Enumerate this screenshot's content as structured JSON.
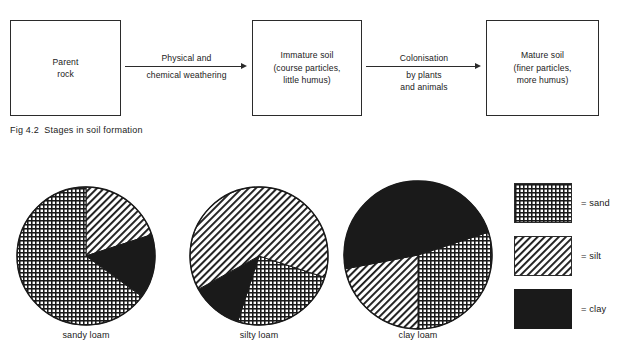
{
  "figure": {
    "caption": "Fig 4.2  Stages in soil formation"
  },
  "flow": {
    "boxes": [
      {
        "id": "parent-rock",
        "text": "Parent\nrock"
      },
      {
        "id": "immature-soil",
        "text": "Immature soil\n(course particles,\nlittle humus)"
      },
      {
        "id": "mature-soil",
        "text": "Mature soil\n(finer particles,\nmore humus)"
      }
    ],
    "arrows": [
      {
        "id": "weathering",
        "label_top": "Physical and",
        "label_bottom": "chemical weathering"
      },
      {
        "id": "colonisation",
        "label_top": "Colonisation",
        "label_bottom": "by plants\nand animals"
      }
    ]
  },
  "legend": {
    "items": [
      {
        "key": "sand",
        "pattern": "crosshatch",
        "text": "= sand"
      },
      {
        "key": "silt",
        "pattern": "diagonal",
        "text": "= silt"
      },
      {
        "key": "clay",
        "pattern": "solid",
        "text": "= clay"
      }
    ]
  },
  "colors": {
    "ink": "#2b2b2b",
    "paper": "#ffffff",
    "clay_fill": "#1a1a1a"
  },
  "chart_data": {
    "type": "pie",
    "categories": [
      "sand",
      "silt",
      "clay"
    ],
    "legend_position": "right",
    "start_angle_deg": 0,
    "charts": [
      {
        "label": "sandy loam",
        "slices": [
          {
            "name": "sand",
            "value": 65,
            "pattern": "crosshatch"
          },
          {
            "name": "silt",
            "value": 20,
            "pattern": "diagonal"
          },
          {
            "name": "clay",
            "value": 15,
            "pattern": "solid"
          }
        ]
      },
      {
        "label": "silty loam",
        "slices": [
          {
            "name": "sand",
            "value": 25,
            "pattern": "crosshatch"
          },
          {
            "name": "silt",
            "value": 63,
            "pattern": "diagonal"
          },
          {
            "name": "clay",
            "value": 12,
            "pattern": "solid"
          }
        ]
      },
      {
        "label": "clay loam",
        "slices": [
          {
            "name": "sand",
            "value": 30,
            "pattern": "crosshatch"
          },
          {
            "name": "silt",
            "value": 22,
            "pattern": "diagonal"
          },
          {
            "name": "clay",
            "value": 48,
            "pattern": "solid"
          }
        ]
      }
    ]
  }
}
